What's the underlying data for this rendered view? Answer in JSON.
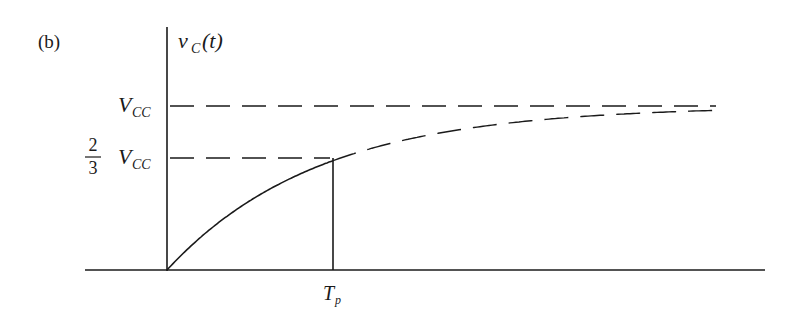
{
  "figure": {
    "panel_label": "(b)",
    "y_axis_label": {
      "main": "v",
      "sub": "C",
      "arg": "(t)"
    },
    "x_axis_tick_label": {
      "main": "T",
      "sub": "p"
    },
    "levels": [
      {
        "name": "vcc",
        "label_main": "V",
        "label_sub": "CC",
        "fraction": "",
        "value": 1.0
      },
      {
        "name": "two-thirds-vcc",
        "label_main": "V",
        "label_sub": "CC",
        "fraction_num": "2",
        "fraction_den": "3",
        "value": 0.6667
      }
    ],
    "curve": {
      "description": "Capacitor charging curve v_C(t) = V_CC (1 - e^(-t/tau)); solid from 0 to T_p, dashed beyond T_p approaching V_CC",
      "solid_until": "T_p",
      "asymptote": "V_CC"
    },
    "colors": {
      "ink": "#1a1a1a",
      "background": "#ffffff"
    }
  }
}
